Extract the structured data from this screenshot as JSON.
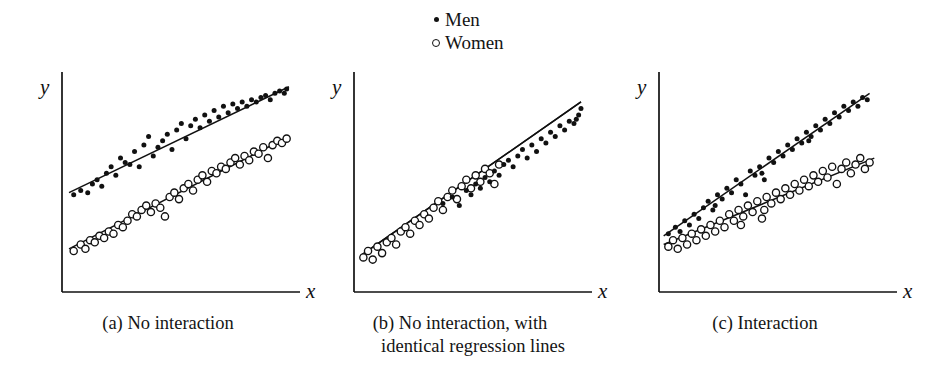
{
  "figure": {
    "background_color": "#ffffff",
    "ink_color": "#111111"
  },
  "legend": {
    "position": "top-center",
    "entries": [
      {
        "marker": "filled-dot-icon",
        "label": "Men"
      },
      {
        "marker": "open-circle-icon",
        "label": "Women"
      }
    ]
  },
  "panels": [
    {
      "id": "a",
      "caption_line_1": "(a) No interaction",
      "caption_line_2": "",
      "x_axis_label": "x",
      "y_axis_label": "y"
    },
    {
      "id": "b",
      "caption_line_1": "(b) No interaction, with",
      "caption_line_2": "identical regression lines",
      "x_axis_label": "x",
      "y_axis_label": "y"
    },
    {
      "id": "c",
      "caption_line_1": "(c) Interaction",
      "caption_line_2": "",
      "x_axis_label": "x",
      "y_axis_label": "y"
    }
  ],
  "chart_data": [
    {
      "type": "scatter",
      "title": "(a) No interaction",
      "xlabel": "x",
      "ylabel": "y",
      "xlim": [
        0,
        100
      ],
      "ylim": [
        0,
        100
      ],
      "grid": false,
      "axis_ticks": false,
      "legend": [
        "Men",
        "Women"
      ],
      "annotations": [
        "Two parallel regression lines; men above women"
      ],
      "series": [
        {
          "name": "Men",
          "marker": "filled-dot",
          "regression_line": {
            "x": [
              3,
              97
            ],
            "y": [
              46,
              95
            ]
          },
          "points": [
            [
              5,
              45
            ],
            [
              8,
              47
            ],
            [
              11,
              46
            ],
            [
              13,
              50
            ],
            [
              15,
              52
            ],
            [
              17,
              49
            ],
            [
              19,
              55
            ],
            [
              21,
              58
            ],
            [
              23,
              54
            ],
            [
              25,
              62
            ],
            [
              27,
              60
            ],
            [
              29,
              59
            ],
            [
              31,
              65
            ],
            [
              33,
              58
            ],
            [
              35,
              68
            ],
            [
              37,
              72
            ],
            [
              39,
              63
            ],
            [
              41,
              67
            ],
            [
              43,
              70
            ],
            [
              45,
              73
            ],
            [
              47,
              66
            ],
            [
              49,
              75
            ],
            [
              51,
              78
            ],
            [
              53,
              71
            ],
            [
              55,
              77
            ],
            [
              57,
              80
            ],
            [
              59,
              76
            ],
            [
              61,
              82
            ],
            [
              63,
              79
            ],
            [
              65,
              84
            ],
            [
              67,
              81
            ],
            [
              69,
              86
            ],
            [
              71,
              83
            ],
            [
              73,
              87
            ],
            [
              75,
              85
            ],
            [
              77,
              88
            ],
            [
              79,
              86
            ],
            [
              81,
              89
            ],
            [
              83,
              88
            ],
            [
              85,
              90
            ],
            [
              87,
              91
            ],
            [
              89,
              89
            ],
            [
              91,
              92
            ],
            [
              93,
              93
            ],
            [
              95,
              92
            ],
            [
              96,
              94
            ]
          ]
        },
        {
          "name": "Women",
          "marker": "open-circle",
          "regression_line": {
            "x": [
              3,
              97
            ],
            "y": [
              20,
              72
            ]
          },
          "points": [
            [
              5,
              19
            ],
            [
              8,
              22
            ],
            [
              10,
              20
            ],
            [
              12,
              24
            ],
            [
              14,
              23
            ],
            [
              16,
              26
            ],
            [
              18,
              25
            ],
            [
              20,
              28
            ],
            [
              22,
              27
            ],
            [
              24,
              31
            ],
            [
              26,
              30
            ],
            [
              28,
              33
            ],
            [
              30,
              36
            ],
            [
              32,
              35
            ],
            [
              34,
              38
            ],
            [
              36,
              40
            ],
            [
              38,
              37
            ],
            [
              40,
              41
            ],
            [
              42,
              39
            ],
            [
              44,
              35
            ],
            [
              46,
              44
            ],
            [
              48,
              46
            ],
            [
              50,
              43
            ],
            [
              52,
              48
            ],
            [
              54,
              50
            ],
            [
              56,
              47
            ],
            [
              58,
              52
            ],
            [
              60,
              54
            ],
            [
              62,
              51
            ],
            [
              64,
              56
            ],
            [
              66,
              55
            ],
            [
              68,
              58
            ],
            [
              70,
              57
            ],
            [
              72,
              60
            ],
            [
              74,
              62
            ],
            [
              76,
              59
            ],
            [
              78,
              63
            ],
            [
              80,
              61
            ],
            [
              82,
              65
            ],
            [
              84,
              64
            ],
            [
              86,
              67
            ],
            [
              88,
              62
            ],
            [
              90,
              68
            ],
            [
              92,
              70
            ],
            [
              94,
              69
            ],
            [
              96,
              71
            ]
          ]
        }
      ]
    },
    {
      "type": "scatter",
      "title": "(b) No interaction, with identical regression lines",
      "xlabel": "x",
      "ylabel": "y",
      "xlim": [
        0,
        100
      ],
      "ylim": [
        0,
        100
      ],
      "grid": false,
      "axis_ticks": false,
      "legend": [
        "Men",
        "Women"
      ],
      "annotations": [
        "A single common regression line for both groups"
      ],
      "series": [
        {
          "name": "Women",
          "marker": "open-circle",
          "regression_line": {
            "x": [
              3,
              97
            ],
            "y": [
              17,
              88
            ]
          },
          "points": [
            [
              4,
              16
            ],
            [
              6,
              19
            ],
            [
              8,
              15
            ],
            [
              10,
              21
            ],
            [
              12,
              18
            ],
            [
              14,
              23
            ],
            [
              16,
              25
            ],
            [
              18,
              22
            ],
            [
              20,
              28
            ],
            [
              22,
              30
            ],
            [
              24,
              27
            ],
            [
              26,
              33
            ],
            [
              28,
              31
            ],
            [
              30,
              36
            ],
            [
              32,
              34
            ],
            [
              34,
              39
            ],
            [
              36,
              42
            ],
            [
              38,
              38
            ],
            [
              40,
              44
            ],
            [
              42,
              47
            ],
            [
              44,
              43
            ],
            [
              46,
              49
            ],
            [
              48,
              52
            ],
            [
              50,
              48
            ],
            [
              52,
              54
            ],
            [
              54,
              51
            ],
            [
              56,
              57
            ],
            [
              58,
              55
            ],
            [
              60,
              50
            ],
            [
              62,
              59
            ]
          ]
        },
        {
          "name": "Men",
          "marker": "filled-dot",
          "regression_line": {
            "x": [
              3,
              97
            ],
            "y": [
              17,
              88
            ]
          },
          "points": [
            [
              38,
              41
            ],
            [
              42,
              44
            ],
            [
              45,
              40
            ],
            [
              48,
              47
            ],
            [
              50,
              45
            ],
            [
              52,
              50
            ],
            [
              54,
              48
            ],
            [
              56,
              53
            ],
            [
              58,
              51
            ],
            [
              60,
              56
            ],
            [
              62,
              54
            ],
            [
              64,
              59
            ],
            [
              66,
              61
            ],
            [
              68,
              58
            ],
            [
              70,
              63
            ],
            [
              72,
              66
            ],
            [
              74,
              62
            ],
            [
              76,
              68
            ],
            [
              78,
              65
            ],
            [
              80,
              71
            ],
            [
              82,
              69
            ],
            [
              84,
              74
            ],
            [
              86,
              72
            ],
            [
              88,
              77
            ],
            [
              90,
              75
            ],
            [
              92,
              79
            ],
            [
              94,
              78
            ],
            [
              96,
              82
            ],
            [
              97,
              85
            ],
            [
              95,
              80
            ]
          ]
        }
      ]
    },
    {
      "type": "scatter",
      "title": "(c) Interaction",
      "xlabel": "x",
      "ylabel": "y",
      "xlim": [
        0,
        100
      ],
      "ylim": [
        0,
        100
      ],
      "grid": false,
      "axis_ticks": false,
      "legend": [
        "Men",
        "Women"
      ],
      "annotations": [
        "Two regression lines with different slopes converging at low x"
      ],
      "series": [
        {
          "name": "Men",
          "marker": "filled-dot",
          "regression_line": {
            "x": [
              2,
              90
            ],
            "y": [
              26,
              92
            ]
          },
          "points": [
            [
              4,
              27
            ],
            [
              7,
              30
            ],
            [
              9,
              28
            ],
            [
              11,
              33
            ],
            [
              13,
              31
            ],
            [
              15,
              36
            ],
            [
              17,
              34
            ],
            [
              19,
              39
            ],
            [
              21,
              42
            ],
            [
              23,
              38
            ],
            [
              25,
              45
            ],
            [
              27,
              43
            ],
            [
              29,
              48
            ],
            [
              31,
              46
            ],
            [
              33,
              52
            ],
            [
              35,
              50
            ],
            [
              37,
              45
            ],
            [
              39,
              56
            ],
            [
              41,
              54
            ],
            [
              43,
              58
            ],
            [
              45,
              52
            ],
            [
              47,
              62
            ],
            [
              49,
              60
            ],
            [
              51,
              65
            ],
            [
              53,
              63
            ],
            [
              55,
              68
            ],
            [
              57,
              66
            ],
            [
              59,
              71
            ],
            [
              61,
              69
            ],
            [
              63,
              74
            ],
            [
              65,
              72
            ],
            [
              67,
              77
            ],
            [
              69,
              75
            ],
            [
              71,
              80
            ],
            [
              73,
              78
            ],
            [
              75,
              83
            ],
            [
              77,
              81
            ],
            [
              79,
              86
            ],
            [
              81,
              84
            ],
            [
              83,
              88
            ],
            [
              85,
              86
            ],
            [
              87,
              90
            ],
            [
              89,
              89
            ],
            [
              64,
              70
            ],
            [
              44,
              55
            ],
            [
              24,
              40
            ]
          ]
        },
        {
          "name": "Women",
          "marker": "open-circle",
          "regression_line": {
            "x": [
              2,
              92
            ],
            "y": [
              22,
              62
            ]
          },
          "points": [
            [
              4,
              21
            ],
            [
              6,
              24
            ],
            [
              8,
              20
            ],
            [
              10,
              25
            ],
            [
              12,
              22
            ],
            [
              14,
              27
            ],
            [
              16,
              24
            ],
            [
              18,
              29
            ],
            [
              20,
              26
            ],
            [
              22,
              31
            ],
            [
              24,
              28
            ],
            [
              26,
              33
            ],
            [
              28,
              30
            ],
            [
              30,
              36
            ],
            [
              32,
              33
            ],
            [
              34,
              38
            ],
            [
              36,
              35
            ],
            [
              38,
              40
            ],
            [
              40,
              37
            ],
            [
              42,
              42
            ],
            [
              44,
              34
            ],
            [
              46,
              44
            ],
            [
              48,
              41
            ],
            [
              50,
              46
            ],
            [
              52,
              43
            ],
            [
              54,
              48
            ],
            [
              56,
              45
            ],
            [
              58,
              50
            ],
            [
              60,
              47
            ],
            [
              62,
              52
            ],
            [
              64,
              49
            ],
            [
              66,
              54
            ],
            [
              68,
              51
            ],
            [
              70,
              56
            ],
            [
              72,
              53
            ],
            [
              74,
              58
            ],
            [
              76,
              50
            ],
            [
              78,
              57
            ],
            [
              80,
              60
            ],
            [
              82,
              55
            ],
            [
              84,
              59
            ],
            [
              86,
              62
            ],
            [
              88,
              57
            ],
            [
              90,
              60
            ],
            [
              35,
              31
            ],
            [
              45,
              38
            ]
          ]
        }
      ]
    }
  ]
}
